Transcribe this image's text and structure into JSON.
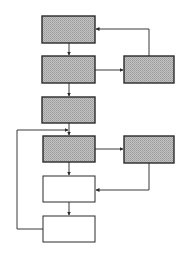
{
  "diagram": {
    "type": "flowchart",
    "colors": {
      "shaded_fill": "#b4b4b4",
      "plain_fill": "#ffffff",
      "stroke": "#2a2a2a",
      "line": "#3a3a3a"
    },
    "nodes": [
      {
        "id": "box1",
        "label": "",
        "shaded": true,
        "x": 42,
        "y": 16,
        "w": 53,
        "h": 27
      },
      {
        "id": "box2",
        "label": "",
        "shaded": true,
        "x": 42,
        "y": 56,
        "w": 53,
        "h": 27
      },
      {
        "id": "box3",
        "label": "",
        "shaded": true,
        "x": 42,
        "y": 97,
        "w": 53,
        "h": 26
      },
      {
        "id": "box4",
        "label": "",
        "shaded": true,
        "x": 43,
        "y": 136,
        "w": 52,
        "h": 26
      },
      {
        "id": "box5",
        "label": "",
        "shaded": false,
        "x": 43,
        "y": 176,
        "w": 52,
        "h": 26
      },
      {
        "id": "box6",
        "label": "",
        "shaded": false,
        "x": 43,
        "y": 216,
        "w": 52,
        "h": 26
      },
      {
        "id": "side1",
        "label": "",
        "shaded": true,
        "x": 124,
        "y": 56,
        "w": 50,
        "h": 27
      },
      {
        "id": "side2",
        "label": "",
        "shaded": true,
        "x": 124,
        "y": 136,
        "w": 50,
        "h": 27
      }
    ],
    "edges": [
      {
        "from": "box1",
        "to": "box2"
      },
      {
        "from": "box2",
        "to": "box3"
      },
      {
        "from": "box2",
        "to": "side1"
      },
      {
        "from": "side1",
        "to": "box1"
      },
      {
        "from": "box3",
        "to": "box4"
      },
      {
        "from": "box4",
        "to": "box5"
      },
      {
        "from": "box4",
        "to": "side2"
      },
      {
        "from": "side2",
        "to": "box5"
      },
      {
        "from": "box5",
        "to": "box6"
      },
      {
        "from": "box6",
        "to": "box4"
      }
    ]
  }
}
